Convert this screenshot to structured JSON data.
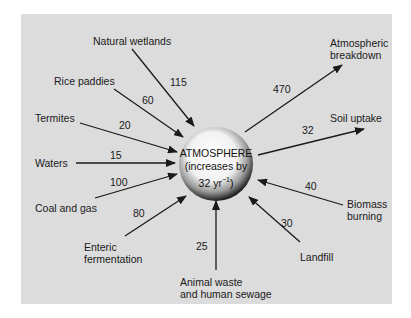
{
  "diagram": {
    "center": {
      "line1": "ATMOSPHERE",
      "line2": "(increases by",
      "line3": "32 yr",
      "superscript": "−1",
      "line3_end": ")"
    },
    "sources": [
      {
        "label": "Natural wetlands",
        "value": "115"
      },
      {
        "label": "Rice paddies",
        "value": "60"
      },
      {
        "label": "Termites",
        "value": "20"
      },
      {
        "label": "Waters",
        "value": "15"
      },
      {
        "label": "Coal and gas",
        "value": "100"
      },
      {
        "label_line1": "Enteric",
        "label_line2": "fermentation",
        "value": "80"
      },
      {
        "label_line1": "Animal waste",
        "label_line2": "and human sewage",
        "value": "25"
      },
      {
        "label": "Landfill",
        "value": "30"
      },
      {
        "label_line1": "Biomass",
        "label_line2": "burning",
        "value": "40"
      }
    ],
    "sinks": [
      {
        "label_line1": "Atmospheric",
        "label_line2": "breakdown",
        "value": "470"
      },
      {
        "label": "Soil uptake",
        "value": "32"
      }
    ],
    "colors": {
      "background": "#dcdcdc",
      "arrow": "#1a1a1a",
      "sphere_light": "#ffffff",
      "sphere_dark": "#1e1e1e"
    }
  }
}
